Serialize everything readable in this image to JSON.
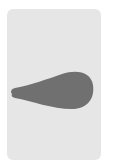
{
  "card": {
    "background": "#e6e6e6",
    "shape": {
      "type": "teardrop",
      "orientation": "point-left",
      "fill": "#707070"
    }
  }
}
